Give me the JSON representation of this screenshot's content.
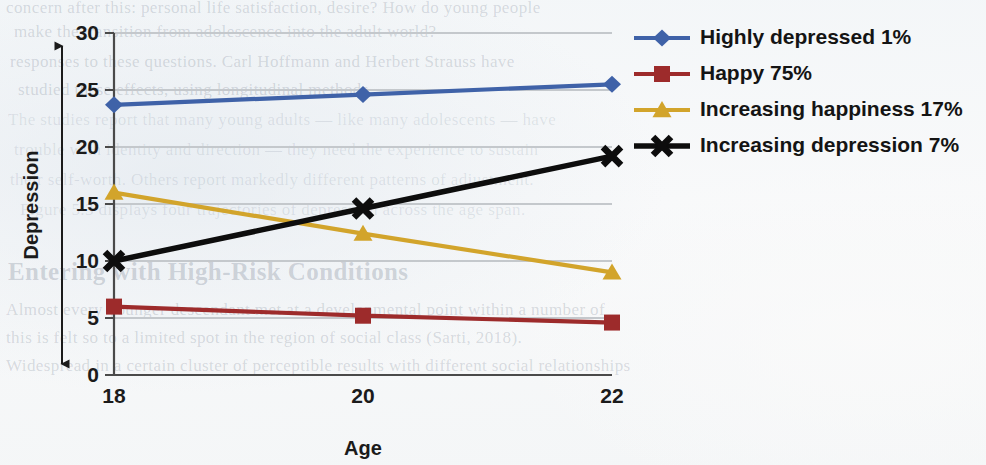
{
  "chart_data": {
    "type": "line",
    "title": "",
    "xlabel": "Age",
    "ylabel": "Depression",
    "x": [
      18,
      20,
      22
    ],
    "xtick_labels": [
      "18",
      "20",
      "22"
    ],
    "ytick_labels": [
      "0",
      "5",
      "10",
      "15",
      "20",
      "25",
      "30"
    ],
    "ylim": [
      0,
      30
    ],
    "xlim": [
      18,
      22
    ],
    "grid": "horizontal",
    "legend_position": "right",
    "series": [
      {
        "name": "Highly depressed 1%",
        "label": "Highly depressed 1%",
        "color": "#3f62a8",
        "marker": "diamond",
        "values": [
          23.7,
          24.6,
          25.5
        ]
      },
      {
        "name": "Happy 75%",
        "label": "Happy 75%",
        "color": "#9d2b2b",
        "marker": "square",
        "values": [
          6.0,
          5.2,
          4.6
        ]
      },
      {
        "name": "Increasing happiness 17%",
        "label": "Increasing happiness 17%",
        "color": "#d2a42b",
        "marker": "triangle",
        "values": [
          16.0,
          12.4,
          9.0
        ]
      },
      {
        "name": "Increasing depression 7%",
        "label": "Increasing depression 7%",
        "color": "#0d0d0d",
        "marker": "x",
        "values": [
          10.0,
          14.6,
          19.2
        ]
      }
    ],
    "axis_arrow": "double-headed vertical arrow beside y-axis title"
  },
  "background_text": {
    "lines": [
      "concern after this: personal life satisfaction, desire? How do young people",
      "make the transition from adolescence into the adult world?",
      "responses to these questions. Carl Hoffmann and Herbert Strauss have",
      "studied these effects, using longitudinal methods.",
      "The studies report that many young adults — like many adolescents — have",
      "trouble with identity and direction — they need the experience to sustain",
      "their self-worth. Others report markedly different patterns of adjustment.",
      "Figure 5.3 displays four trajectories of depression across the age span.",
      "Entering with High-Risk Conditions",
      "Almost every younger descendant met at a developmental point within a number of",
      "this is felt so to a limited spot in the region of social class (Sarti, 2018).",
      "Widespread in a certain cluster of perceptible results with different social relationships"
    ]
  }
}
